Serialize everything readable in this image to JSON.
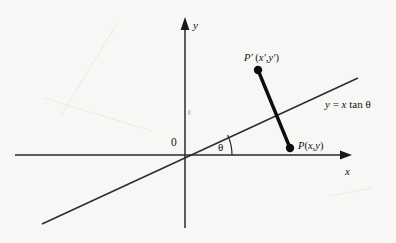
{
  "figure": {
    "type": "geometry-diagram",
    "background_color": "#f7f7f5",
    "ink_color": "#111111"
  },
  "axes": {
    "x_label": "x",
    "y_label": "y",
    "origin_label": "0",
    "x_axis": {
      "x1": 15,
      "y1": 155,
      "x2": 352,
      "y2": 155,
      "arrow": "right"
    },
    "y_axis": {
      "x1": 185,
      "y1": 228,
      "x2": 185,
      "y2": 17,
      "arrow": "up"
    }
  },
  "mirror_line": {
    "label": "y = x tan θ",
    "label_parts": {
      "y": "y",
      "equals": "=",
      "x": "x",
      "tan": "tan",
      "theta": "θ"
    },
    "x1": 42,
    "y1": 224,
    "x2": 358,
    "y2": 78
  },
  "angle": {
    "label": "θ",
    "vertex_x": 185,
    "vertex_y": 155,
    "arc_radius": 47,
    "degrees": 25
  },
  "points": [
    {
      "name": "P-prime",
      "label": "P' (x',y')",
      "label_parts": {
        "p": "P",
        "prime": "′",
        "open": "(",
        "x": "x",
        "xprime": "′",
        "comma": ",",
        "y": "y",
        "yprime": "′",
        "close": ")"
      },
      "x": 258,
      "y": 70,
      "dot_radius": 4.2
    },
    {
      "name": "P",
      "label": "P(x,y)",
      "label_parts": {
        "p": "P",
        "open": "(",
        "x": "x",
        "comma": ",",
        "y": "y",
        "close": ")"
      },
      "x": 290,
      "y": 148,
      "dot_radius": 4.2
    }
  ],
  "segment": {
    "name": "PP-prime-segment",
    "from_x": 258,
    "from_y": 70,
    "to_x": 290,
    "to_y": 148,
    "stroke_width": 3.4
  }
}
